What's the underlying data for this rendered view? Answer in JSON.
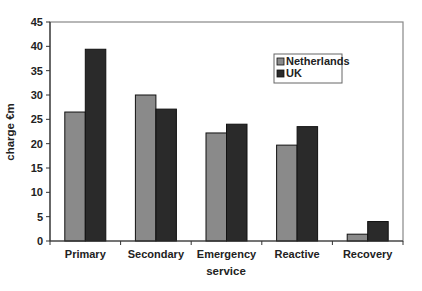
{
  "chart_data": {
    "type": "bar",
    "title": "",
    "xlabel": "service",
    "ylabel": "charge €m",
    "ylim": [
      0,
      45
    ],
    "yticks": [
      0,
      5,
      10,
      15,
      20,
      25,
      30,
      35,
      40,
      45
    ],
    "grid": false,
    "legend_position": "upper right (inside plot)",
    "categories": [
      "Primary",
      "Secondary",
      "Emergency",
      "Reactive",
      "Recovery"
    ],
    "series": [
      {
        "name": "Netherlands",
        "color": "#8a8a8a",
        "values": [
          26.5,
          30.0,
          22.2,
          19.7,
          1.4
        ]
      },
      {
        "name": "UK",
        "color": "#2a2a2a",
        "values": [
          39.4,
          27.1,
          24.0,
          23.5,
          4.0
        ]
      }
    ]
  }
}
